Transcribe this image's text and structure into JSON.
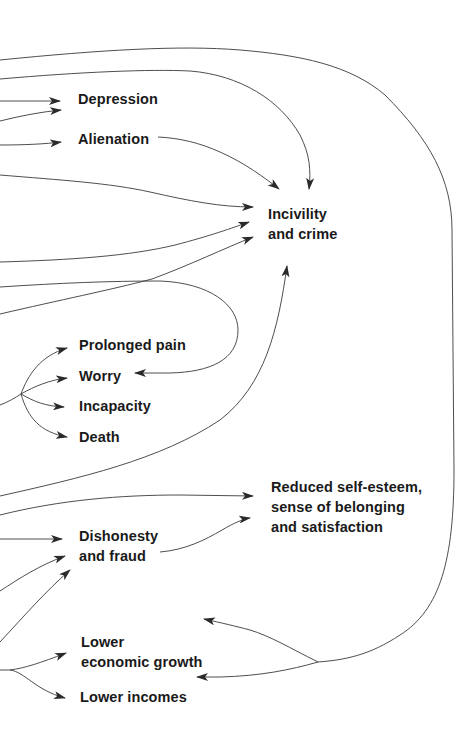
{
  "diagram": {
    "type": "cause-effect flow diagram",
    "colors": {
      "background": "#ffffff",
      "text": "#1a1a1a",
      "lines": "#3a3a3a"
    },
    "nodes": {
      "depression": {
        "lines": [
          "Depression"
        ]
      },
      "alienation": {
        "lines": [
          "Alienation"
        ]
      },
      "incivility": {
        "lines": [
          "Incivility",
          "and crime"
        ]
      },
      "prolonged_pain": {
        "lines": [
          "Prolonged pain"
        ]
      },
      "worry": {
        "lines": [
          "Worry"
        ]
      },
      "incapacity": {
        "lines": [
          "Incapacity"
        ]
      },
      "death": {
        "lines": [
          "Death"
        ]
      },
      "self_esteem": {
        "lines": [
          "Reduced self-esteem,",
          "sense of belonging",
          "and satisfaction"
        ]
      },
      "dishonesty": {
        "lines": [
          "Dishonesty",
          "and fraud"
        ]
      },
      "economic_growth": {
        "lines": [
          "Lower",
          "economic growth"
        ]
      },
      "lower_incomes": {
        "lines": [
          "Lower incomes"
        ]
      }
    },
    "edges": [
      {
        "from": "left-offscreen",
        "to": "depression"
      },
      {
        "from": "left-offscreen",
        "to": "depression"
      },
      {
        "from": "left-offscreen",
        "to": "alienation"
      },
      {
        "from": "alienation",
        "to": "incivility"
      },
      {
        "from": "left-offscreen",
        "to": "incivility"
      },
      {
        "from": "left-offscreen",
        "to": "incivility"
      },
      {
        "from": "left-offscreen",
        "to": "incivility"
      },
      {
        "from": "left-offscreen",
        "to": "incivility"
      },
      {
        "from": "left-offscreen",
        "to": "incivility"
      },
      {
        "from": "left-offscreen",
        "to": "worry"
      },
      {
        "from": "left-offscreen",
        "to": "prolonged_pain"
      },
      {
        "from": "left-offscreen",
        "to": "worry"
      },
      {
        "from": "left-offscreen",
        "to": "incapacity"
      },
      {
        "from": "left-offscreen",
        "to": "death"
      },
      {
        "from": "left-offscreen",
        "to": "self_esteem"
      },
      {
        "from": "dishonesty",
        "to": "self_esteem"
      },
      {
        "from": "left-offscreen",
        "to": "dishonesty"
      },
      {
        "from": "left-offscreen",
        "to": "dishonesty"
      },
      {
        "from": "left-offscreen",
        "to": "dishonesty"
      },
      {
        "from": "left-offscreen",
        "to": "economic_growth"
      },
      {
        "from": "left-offscreen",
        "to": "lower_incomes"
      },
      {
        "from": "left-offscreen",
        "to": "economic_growth"
      },
      {
        "from": "left-offscreen",
        "to": "lower_incomes"
      }
    ]
  }
}
